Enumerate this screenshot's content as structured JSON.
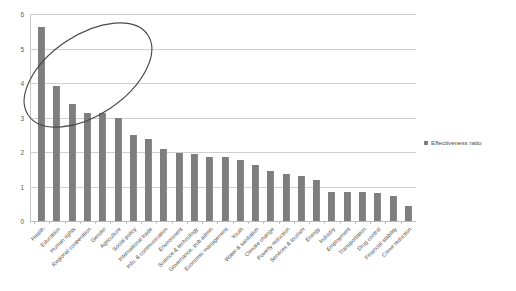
{
  "chart_data": {
    "type": "bar",
    "title": "",
    "xlabel": "",
    "ylabel": "",
    "ylim": [
      0,
      6
    ],
    "ytick_step": 1,
    "yticks": [
      "6",
      "5",
      "4",
      "3",
      "2",
      "1",
      "0"
    ],
    "grid": true,
    "legend_position": "right",
    "bar_color": "#7e7e7e",
    "series": [
      {
        "name": "Effectiveness ratio",
        "values": [
          5.62,
          3.9,
          3.38,
          3.14,
          3.12,
          2.98,
          2.5,
          2.38,
          2.09,
          1.98,
          1.95,
          1.87,
          1.87,
          1.78,
          1.63,
          1.46,
          1.35,
          1.3,
          1.2,
          0.85,
          0.84,
          0.83,
          0.82,
          0.73,
          0.44
        ]
      }
    ],
    "categories": [
      "Health",
      "Education",
      "Human rights",
      "Regional cooperation",
      "Gender",
      "Agriculture",
      "Social policy",
      "International trade",
      "Info. & communication",
      "Environment",
      "Science & technology",
      "Governance, pub admin",
      "Economic management",
      "Youth",
      "Water & sanitation",
      "Climate change",
      "Poverty reduction",
      "Services & tourism",
      "Energy",
      "Industry",
      "Employment",
      "Transportation",
      "Drug control",
      "Financial stability",
      "Crime reduction"
    ]
  },
  "legend": {
    "label": "Effectiveness ratio",
    "swatch_color": "#7e7e7e"
  },
  "annotations": [
    {
      "name": "highlight-ellipse",
      "shape": "ellipse",
      "color": "#4a4a4a",
      "covers": "Health through Agriculture"
    }
  ]
}
